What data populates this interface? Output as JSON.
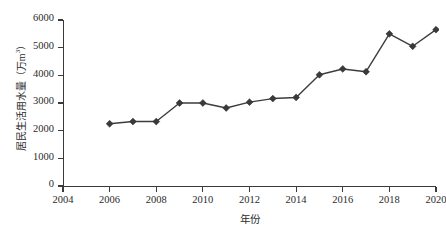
{
  "chart_data": {
    "type": "line",
    "title": "",
    "xlabel": "年份",
    "ylabel": "居民生活用水量（万m³）",
    "ylabel_main": "居民生活用水量（万m",
    "ylabel_sup": "3",
    "ylabel_tail": "）",
    "x": [
      2006,
      2007,
      2008,
      2009,
      2010,
      2011,
      2012,
      2013,
      2014,
      2015,
      2016,
      2017,
      2018,
      2019,
      2020
    ],
    "values": [
      2250,
      2330,
      2330,
      3000,
      3000,
      2820,
      3030,
      3160,
      3200,
      4020,
      4230,
      4130,
      5500,
      5050,
      5650
    ],
    "series": [
      {
        "name": "居民生活用水量",
        "values": [
          2250,
          2330,
          2330,
          3000,
          3000,
          2820,
          3030,
          3160,
          3200,
          4020,
          4230,
          4130,
          5500,
          5050,
          5650
        ]
      }
    ],
    "xlim": [
      2004,
      2020
    ],
    "ylim": [
      0,
      6000
    ],
    "xticks": [
      2004,
      2006,
      2008,
      2010,
      2012,
      2014,
      2016,
      2018,
      2020
    ],
    "xtick_labels": [
      "2004",
      "2006",
      "2008",
      "2010",
      "2012",
      "2014",
      "2016",
      "2018",
      "2020"
    ],
    "yticks": [
      0,
      1000,
      2000,
      3000,
      4000,
      5000,
      6000
    ],
    "ytick_labels": [
      "0",
      "1000",
      "2000",
      "3000",
      "4000",
      "5000",
      "6000"
    ],
    "grid": false,
    "legend": false,
    "marker": "diamond",
    "line_color": "#3d3d3d",
    "marker_color": "#3a3a3a"
  }
}
